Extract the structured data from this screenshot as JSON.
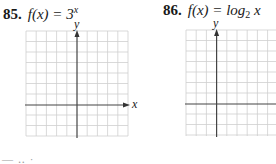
{
  "problems": [
    {
      "number": "85.",
      "function_prefix": "f(x) = 3",
      "function_exponent": "x",
      "grid": {
        "columns": 10,
        "rows": 10,
        "x_axis_row_from_top": 7,
        "y_axis_col_from_left": 5,
        "x_label": "x",
        "y_label": "y"
      }
    },
    {
      "number": "86.",
      "function_prefix": "f(x) = log",
      "function_base": "2",
      "function_suffix": " x",
      "grid": {
        "columns": 10,
        "rows": 10,
        "x_axis_row_from_top": 7,
        "y_axis_col_from_left": 3,
        "x_label": "",
        "y_label": "y"
      }
    }
  ],
  "footer": {
    "partial_text": "— ‥ ·"
  },
  "colors": {
    "grid_line": "#c8c8c8",
    "axis_line": "#444444",
    "text": "#1a1a1a"
  }
}
